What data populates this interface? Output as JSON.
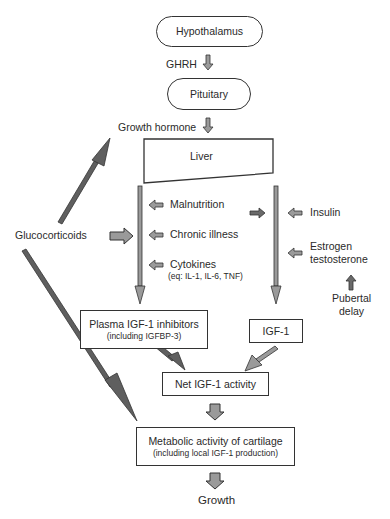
{
  "nodes": {
    "hypothalamus": "Hypothalamus",
    "pituitary": "Pituitary",
    "liver": "Liver",
    "plasma_inhibitors": "Plasma IGF-1 inhibitors",
    "plasma_inhibitors_sub": "(including IGFBP-3)",
    "igf1": "IGF-1",
    "net_igf1": "Net IGF-1 activity",
    "metabolic": "Metabolic activity of cartilage",
    "metabolic_sub": "(including local IGF-1 production)",
    "growth": "Growth"
  },
  "labels": {
    "ghrh": "GHRH",
    "growth_hormone": "Growth hormone",
    "glucocorticoids": "Glucocorticoids",
    "malnutrition": "Malnutrition",
    "chronic_illness": "Chronic illness",
    "cytokines": "Cytokines",
    "cytokines_sub": "(eq: IL-1, IL-6, TNF)",
    "insulin": "Insulin",
    "estrogen": "Estrogen",
    "testosterone": "testosterone",
    "pubertal": "Pubertal",
    "delay": "delay"
  },
  "colors": {
    "arrow_fill": "#9a9a9a",
    "arrow_dark": "#5a5a5a",
    "outline": "#333333"
  }
}
